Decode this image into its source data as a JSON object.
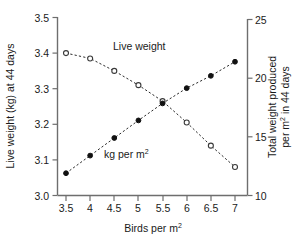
{
  "chart_data": {
    "type": "line",
    "title": "",
    "xlabel": "Birds per m²",
    "ylabel": "Live weight (kg) at 44 days",
    "y2label": "Total weight produced per m² in 44 days",
    "x": [
      3.5,
      4,
      4.5,
      5,
      5.5,
      6,
      6.5,
      7
    ],
    "xticklabels": [
      "3.5",
      "4",
      "4.5",
      "5",
      "5.5",
      "6",
      "6.5",
      "7"
    ],
    "xlim": [
      3.25,
      7.25
    ],
    "ylim": [
      3.0,
      3.5
    ],
    "yticks": [
      3.0,
      3.1,
      3.2,
      3.3,
      3.4,
      3.5
    ],
    "yticklabels": [
      "3.0",
      "3.1",
      "3.2",
      "3.3",
      "3.4",
      "3.5"
    ],
    "y2lim": [
      10,
      25
    ],
    "y2ticks": [
      10,
      15,
      20,
      25
    ],
    "y2ticklabels": [
      "10",
      "15",
      "20",
      "25"
    ],
    "grid": false,
    "legend": "inline-annotations",
    "series": [
      {
        "name": "Live weight",
        "label": "Live weight",
        "axis": "left",
        "marker": "open-circle",
        "linestyle": "dashed",
        "color": "#3a3a3a",
        "values": [
          3.4,
          3.385,
          3.35,
          3.31,
          3.265,
          3.205,
          3.14,
          3.08
        ]
      },
      {
        "name": "kg per m2",
        "label": "kg per m²",
        "axis": "right",
        "marker": "filled-circle",
        "linestyle": "dashed",
        "color": "#111111",
        "values": [
          11.9,
          13.4,
          14.9,
          16.4,
          17.85,
          19.15,
          20.2,
          21.4
        ]
      }
    ],
    "annotations": [
      {
        "text": "Live weight",
        "x": 4.65,
        "y": 3.405,
        "axis": "left"
      },
      {
        "text": "kg per m²",
        "x": 4.8,
        "y": 13.3,
        "axis": "right"
      }
    ]
  },
  "labels": {
    "x_axis_title_main": "Birds per m",
    "x_axis_title_sup": "2",
    "y_left_axis_title": "Live weight (kg) at 44 days",
    "y_right_axis_title_line1": "Total weight produced",
    "y_right_axis_title_line2_main": "per m",
    "y_right_axis_title_line2_sup": "2",
    "y_right_axis_title_line2_tail": " in 44 days",
    "series1_label": "Live weight",
    "series2_label_main": "kg per m",
    "series2_label_sup": "2"
  },
  "colors": {
    "axis": "#6e6e6e",
    "text": "#1a1a1a",
    "series_open": "#3a3a3a",
    "series_filled": "#111111",
    "background": "#ffffff"
  }
}
